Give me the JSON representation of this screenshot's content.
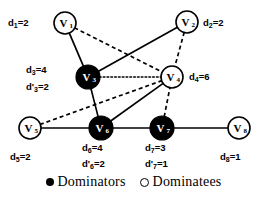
{
  "figure": {
    "type": "graph-diagram",
    "width": 267,
    "height": 206,
    "background": "#ffffff",
    "stroke_color": "#000000",
    "dominator_fill": "#000000",
    "dominatee_fill": "#ffffff"
  },
  "nodes": [
    {
      "id": "V1",
      "label": "V",
      "sub": "1",
      "cx": 65,
      "cy": 23,
      "r": 11,
      "role": "dominatee"
    },
    {
      "id": "V2",
      "label": "V",
      "sub": "2",
      "cx": 187,
      "cy": 22,
      "r": 11,
      "role": "dominatee"
    },
    {
      "id": "V3",
      "label": "V",
      "sub": "3",
      "cx": 88,
      "cy": 77,
      "r": 12,
      "role": "dominator"
    },
    {
      "id": "V4",
      "label": "V",
      "sub": "4",
      "cx": 172,
      "cy": 77,
      "r": 11,
      "role": "dominatee"
    },
    {
      "id": "V5",
      "label": "V",
      "sub": "5",
      "cx": 30,
      "cy": 128,
      "r": 11,
      "role": "dominatee"
    },
    {
      "id": "V6",
      "label": "V",
      "sub": "6",
      "cx": 101,
      "cy": 128,
      "r": 12,
      "role": "dominator"
    },
    {
      "id": "V7",
      "label": "V",
      "sub": "7",
      "cx": 162,
      "cy": 128,
      "r": 12,
      "role": "dominator"
    },
    {
      "id": "V8",
      "label": "V",
      "sub": "8",
      "cx": 239,
      "cy": 128,
      "r": 11,
      "role": "dominatee"
    }
  ],
  "edges": [
    {
      "from": "V1",
      "to": "V3",
      "style": "solid"
    },
    {
      "from": "V1",
      "to": "V4",
      "style": "dashed"
    },
    {
      "from": "V3",
      "to": "V2",
      "style": "solid"
    },
    {
      "from": "V3",
      "to": "V4",
      "style": "dotted"
    },
    {
      "from": "V3",
      "to": "V6",
      "style": "solid"
    },
    {
      "from": "V2",
      "to": "V4",
      "style": "dashed"
    },
    {
      "from": "V5",
      "to": "V4",
      "style": "dashed"
    },
    {
      "from": "V5",
      "to": "V6",
      "style": "solid"
    },
    {
      "from": "V6",
      "to": "V4",
      "style": "solid"
    },
    {
      "from": "V6",
      "to": "V7",
      "style": "solid"
    },
    {
      "from": "V7",
      "to": "V4",
      "style": "dashed"
    },
    {
      "from": "V7",
      "to": "V8",
      "style": "solid"
    }
  ],
  "annotations": [
    {
      "id": "d1",
      "text": "d",
      "sub": "1",
      "value": "=2",
      "x": 8,
      "y": 18,
      "node": "V1"
    },
    {
      "id": "d2",
      "text": "d",
      "sub": "2",
      "value": "=2",
      "x": 203,
      "y": 18,
      "node": "V2"
    },
    {
      "id": "d3",
      "text": "d",
      "sub": "3",
      "value": "=4",
      "x": 26,
      "y": 65,
      "node": "V3"
    },
    {
      "id": "d3p",
      "text": "d'",
      "sub": "3",
      "value": "=2",
      "x": 26,
      "y": 82,
      "node": "V3"
    },
    {
      "id": "d4",
      "text": "d",
      "sub": "4",
      "value": "=6",
      "x": 189,
      "y": 72,
      "node": "V4"
    },
    {
      "id": "d5",
      "text": "d",
      "sub": "5",
      "value": "=2",
      "x": 10,
      "y": 152,
      "node": "V5"
    },
    {
      "id": "d6",
      "text": "d",
      "sub": "6",
      "value": "=4",
      "x": 82,
      "y": 143,
      "node": "V6"
    },
    {
      "id": "d6p",
      "text": "d'",
      "sub": "6",
      "value": "=2",
      "x": 82,
      "y": 159,
      "node": "V6"
    },
    {
      "id": "d7",
      "text": "d",
      "sub": "7",
      "value": "=3",
      "x": 145,
      "y": 143,
      "node": "V7"
    },
    {
      "id": "d7p",
      "text": "d'",
      "sub": "7",
      "value": "=1",
      "x": 145,
      "y": 159,
      "node": "V7"
    },
    {
      "id": "d8",
      "text": "d",
      "sub": "8",
      "value": "=1",
      "x": 220,
      "y": 152,
      "node": "V8"
    }
  ],
  "legend": {
    "dominators_label": "Dominators",
    "dominatees_label": "Dominatees"
  }
}
